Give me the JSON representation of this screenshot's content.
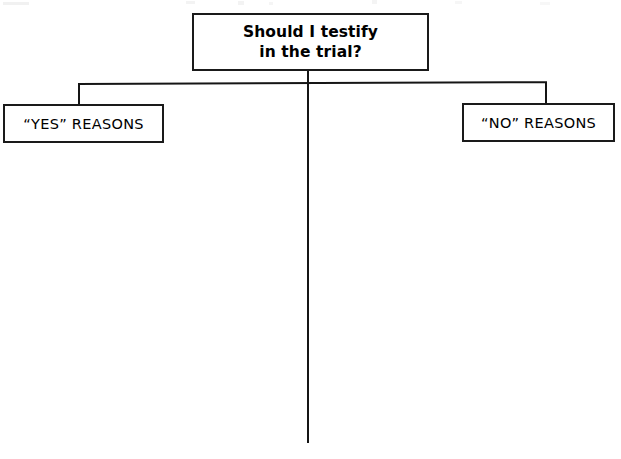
{
  "document": {
    "type": "decision-worksheet",
    "orientation": "landscape"
  },
  "diagram": {
    "question": {
      "line1": "Should I testify",
      "line2": "in the trial?",
      "full_text": "Should I testify in the trial?"
    },
    "branches": [
      {
        "id": "yes",
        "label": "“YES” REASONS",
        "side": "left"
      },
      {
        "id": "no",
        "label": "“NO” REASONS",
        "side": "right"
      }
    ],
    "colors": {
      "ink": "#151515",
      "paper": "#ffffff",
      "border": "#1a1a1a"
    },
    "connectors": {
      "stem": "vertical-center-divider",
      "bus": "horizontal-branch-bus",
      "yes_drop": "elbow-to-yes-box",
      "no_drop": "elbow-to-no-box"
    }
  }
}
